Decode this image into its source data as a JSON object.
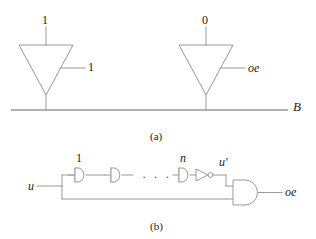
{
  "figure": {
    "panel_a": {
      "caption": "(a)",
      "bus_label": "B",
      "buffers": [
        {
          "name": "left-tristate-buffer",
          "data_input_label": "1",
          "enable_label": "1",
          "output_target": "B"
        },
        {
          "name": "right-tristate-buffer",
          "data_input_label": "0",
          "enable_label": "oe",
          "output_target": "B"
        }
      ]
    },
    "panel_b": {
      "caption": "(b)",
      "input_label": "u",
      "output_label": "oe",
      "intermediate_label": "u'",
      "stage_first_label": "1",
      "stage_last_label": "n",
      "ellipsis": "· · ·",
      "elements": [
        {
          "name": "buffer-stage-1",
          "label": "1"
        },
        {
          "name": "buffer-stage-2",
          "label": ""
        },
        {
          "name": "buffer-stage-n",
          "label": "n"
        },
        {
          "name": "inverter",
          "label": ""
        },
        {
          "name": "and-gate-output",
          "label": ""
        }
      ]
    },
    "colors": {
      "line": "#9a9a9a",
      "text": "#1a1a1a",
      "background": "#ffffff"
    }
  }
}
